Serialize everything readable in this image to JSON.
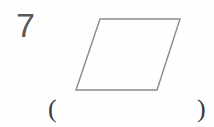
{
  "page": {
    "width": 214,
    "height": 127,
    "background_color": "#fefefe"
  },
  "question": {
    "number": "7",
    "number_color": "#59595b"
  },
  "figure": {
    "name": "parallelogram",
    "stroke_color": "#8a8a8c",
    "fill_color": "none",
    "stroke_width": 1.4,
    "vertices": [
      {
        "label": "top-left",
        "x": 100,
        "y": 19
      },
      {
        "label": "top-right",
        "x": 180,
        "y": 19
      },
      {
        "label": "bottom-right",
        "x": 157,
        "y": 90
      },
      {
        "label": "bottom-left",
        "x": 76,
        "y": 90
      }
    ],
    "points_string": "100,19 180,19 157,90 76,90"
  },
  "answer": {
    "paren_open": "(",
    "paren_close": ")",
    "value": "",
    "paren_color": "#3a3a3c"
  }
}
